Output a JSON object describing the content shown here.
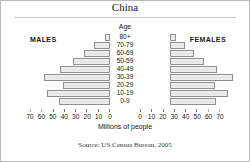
{
  "title": "China",
  "labels": {
    "males": "MALES",
    "females": "FEMALES",
    "age": "Age",
    "xlabel": "Millions of people",
    "source": "Source: US Census Bureau, 2005"
  },
  "chart_data": {
    "type": "bar",
    "subtype": "population-pyramid",
    "title": "China",
    "xlabel": "Millions of people",
    "ylabel": "Age",
    "grid": false,
    "legend": [
      "MALES",
      "FEMALES"
    ],
    "legend_position": "top-left and top-right",
    "axis_direction": "left axis decreasing outward, right axis increasing outward",
    "xlim": [
      0,
      70
    ],
    "xticks": [
      0,
      10,
      20,
      30,
      40,
      50,
      60,
      70
    ],
    "xticklabels_left": [
      "70",
      "60",
      "50",
      "40",
      "30",
      "20",
      "10",
      "0"
    ],
    "xticklabels_right": [
      "0",
      "10",
      "20",
      "30",
      "40",
      "50",
      "60",
      "70"
    ],
    "categories": [
      "80+",
      "70-79",
      "60-69",
      "50-59",
      "40-49",
      "30-39",
      "20-29",
      "10-19",
      "0-9"
    ],
    "series": [
      {
        "name": "MALES",
        "side": "left",
        "values": [
          4,
          14,
          23,
          32,
          44,
          58,
          41,
          55,
          45
        ]
      },
      {
        "name": "FEMALES",
        "side": "right",
        "values": [
          5,
          13,
          21,
          30,
          41,
          55,
          39,
          51,
          40
        ]
      }
    ],
    "units": "millions of people",
    "source": "Source: US Census Bureau, 2005",
    "colors": {
      "bar_fill": "#e8e8e8",
      "bar_border": "#8e8e8e",
      "text": "#141414"
    }
  }
}
